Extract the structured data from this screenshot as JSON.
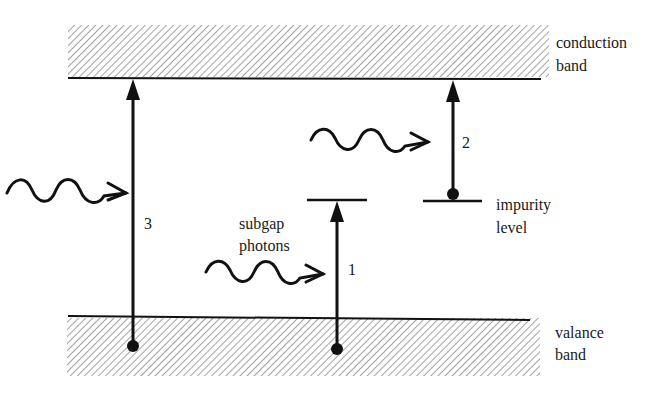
{
  "diagram": {
    "conduction_band": {
      "label_line1": "conduction",
      "label_line2": "band"
    },
    "valence_band": {
      "label_line1": "valance",
      "label_line2": "band"
    },
    "impurity_level": {
      "label_line1": "impurity",
      "label_line2": "level"
    },
    "subgap_photons": {
      "label_line1": "subgap",
      "label_line2": "photons"
    },
    "transitions": [
      {
        "number": "1",
        "description": "valence band to subgap level"
      },
      {
        "number": "2",
        "description": "impurity level to conduction band"
      },
      {
        "number": "3",
        "description": "valence band to conduction band"
      }
    ],
    "colors": {
      "line": "#111111",
      "hatch": "#8a8a8a",
      "background": "#ffffff"
    }
  }
}
